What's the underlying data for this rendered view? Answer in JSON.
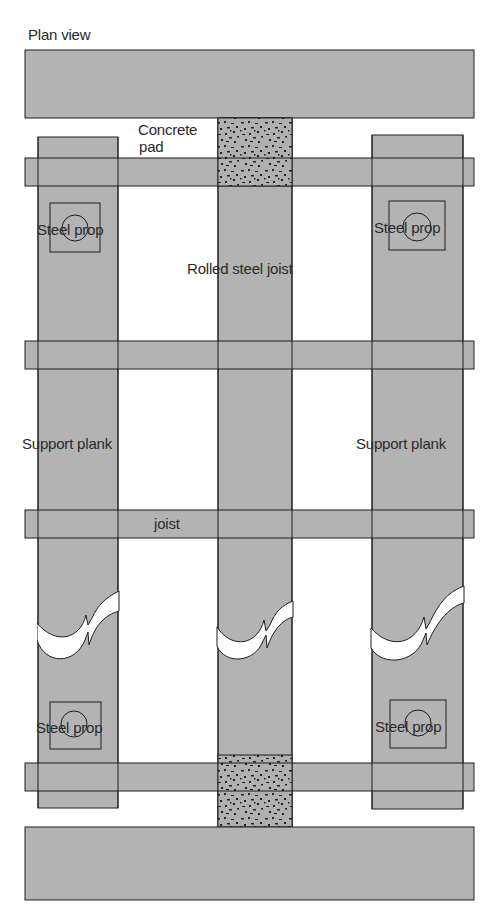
{
  "title": "Plan view",
  "labels": {
    "concrete_pad_line1": "Concrete",
    "concrete_pad_line2": "pad",
    "steel_prop_top_left": "Steel prop",
    "steel_prop_top_right": "Steel prop",
    "rolled_steel_joist": "Rolled steel joist",
    "support_plank_left": "Support plank",
    "support_plank_right": "Support plank",
    "joist": "joist",
    "steel_prop_bottom_left": "Steel prop",
    "steel_prop_bottom_right": "Steel prop"
  },
  "colors": {
    "timber_fill": "#b3b3b3",
    "outline": "#1e1e1e",
    "concrete_fill": "#b0b0b0",
    "background": "#ffffff"
  }
}
